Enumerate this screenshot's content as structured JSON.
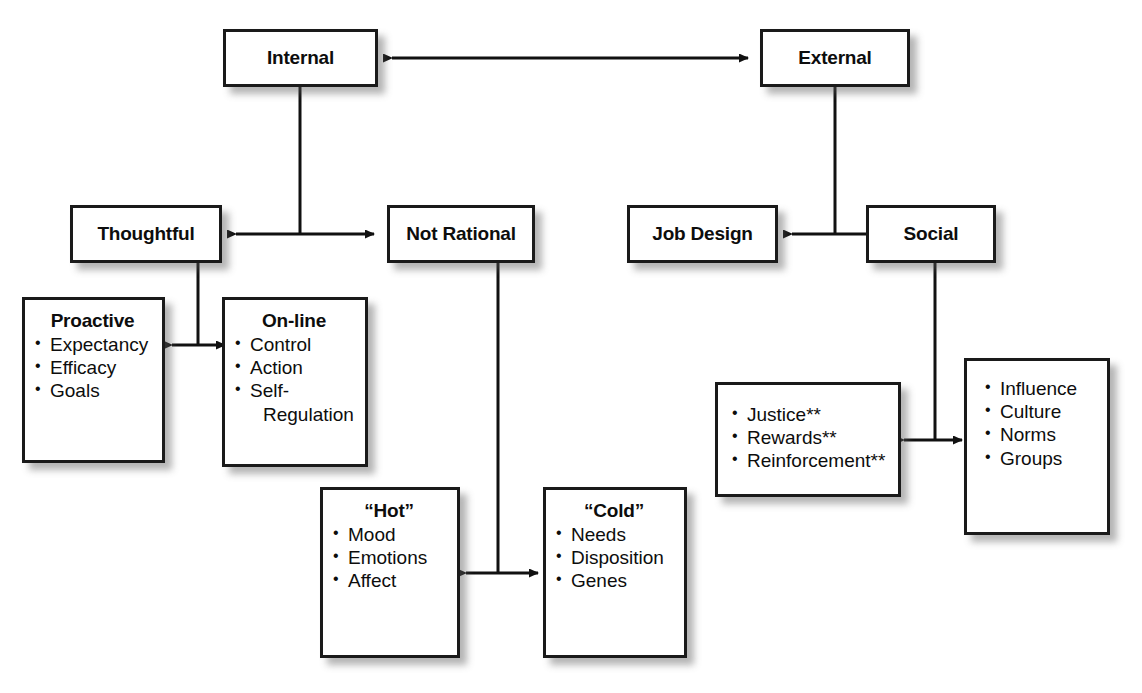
{
  "diagram": {
    "colors": {
      "box_border": "#1a1a1a",
      "box_fill": "#ffffff",
      "line": "#111111",
      "shadow": "rgba(90,90,90,0.45)"
    },
    "nodes": {
      "internal": {
        "label": "Internal"
      },
      "external": {
        "label": "External"
      },
      "thoughtful": {
        "label": "Thoughtful"
      },
      "not_rational": {
        "label": "Not Rational"
      },
      "job_design": {
        "label": "Job Design"
      },
      "social": {
        "label": "Social"
      },
      "proactive": {
        "label": "Proactive",
        "items": [
          "Expectancy",
          "Efficacy",
          "Goals"
        ]
      },
      "online": {
        "label": "On-line",
        "items": [
          "Control",
          "Action",
          "Self-",
          "Regulation"
        ]
      },
      "hot": {
        "label": "“Hot”",
        "items": [
          "Mood",
          "Emotions",
          "Affect"
        ]
      },
      "cold": {
        "label": "“Cold”",
        "items": [
          "Needs",
          "Disposition",
          "Genes"
        ]
      },
      "justice": {
        "label": "",
        "items": [
          "Justice**",
          "Rewards**",
          "Reinforcement**"
        ]
      },
      "influence": {
        "label": "",
        "items": [
          "Influence",
          "Culture",
          "Norms",
          "Groups"
        ]
      }
    },
    "connections": [
      {
        "name": "internal-external",
        "type": "double-arrow"
      },
      {
        "name": "internal-to-thoughtful-not-rational",
        "type": "split-double-arrow"
      },
      {
        "name": "external-to-jobdesign-social",
        "type": "split-double-arrow"
      },
      {
        "name": "thoughtful-to-proactive-online",
        "type": "split-double-arrow"
      },
      {
        "name": "not-rational-to-hot-cold",
        "type": "split-double-arrow"
      },
      {
        "name": "social-to-justice-influence",
        "type": "split-double-arrow"
      }
    ]
  }
}
